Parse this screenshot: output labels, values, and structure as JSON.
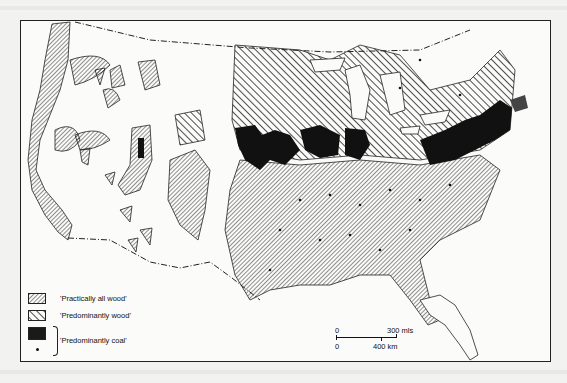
{
  "map": {
    "subject": "United States fuel use (wood vs coal)",
    "legend": [
      {
        "pattern": "dense-diagonal-hatch",
        "label": "'Practically all wood'"
      },
      {
        "pattern": "wide-diagonal-hatch",
        "label": "'Predominantly wood'"
      },
      {
        "pattern": "solid-black",
        "label": "'Predominantly coal'"
      },
      {
        "pattern": "dot",
        "label": ""
      }
    ],
    "scale": {
      "mi_start": "0",
      "mi_end": "300 mls",
      "km_start": "0",
      "km_end": "400 km"
    },
    "colors": {
      "ink": "#1a1a1a",
      "paper": "#fbfbfa",
      "page": "#f2f2f0"
    }
  }
}
